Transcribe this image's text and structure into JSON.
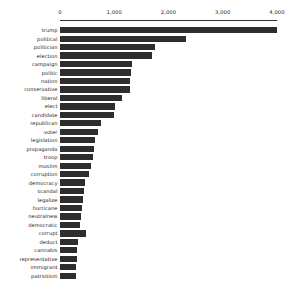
{
  "chart_data": {
    "type": "bar",
    "orientation": "horizontal",
    "title": "",
    "subtitle": "",
    "xlabel": "",
    "ylabel": "",
    "xlim": [
      0,
      4200
    ],
    "grid": false,
    "legend": false,
    "legend_position": "none",
    "bar_color": "#2e2e2e",
    "axis_color": "#333333",
    "text_color": "#222222",
    "background_color": "#ffffff",
    "xticks": [
      0,
      1000,
      2000,
      3000,
      4000
    ],
    "xtick_labels": [
      "0",
      "1,000",
      "2,000",
      "3,000",
      "4,000"
    ],
    "categories": [
      "trump",
      "political",
      "politician",
      "election",
      "campaign",
      "politic",
      "nation",
      "conservative",
      "liberal",
      "elect",
      "candidate",
      "republican",
      "voter",
      "legislation",
      "propaganda",
      "troop",
      "muslim",
      "corruption",
      "democracy",
      "scandal",
      "legalize",
      "hurricane",
      "neutralnew",
      "democratic",
      "corrupt",
      "deduct",
      "cannabis",
      "representative",
      "immigrant",
      "patriotism"
    ],
    "values": [
      4000,
      2320,
      1745,
      1690,
      1320,
      1300,
      1290,
      1290,
      1140,
      1010,
      1000,
      760,
      700,
      650,
      620,
      600,
      570,
      540,
      470,
      440,
      420,
      400,
      380,
      370,
      480,
      330,
      320,
      310,
      300,
      290
    ]
  }
}
